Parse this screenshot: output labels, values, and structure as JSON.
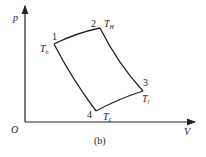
{
  "diagram": {
    "type": "p-V cycle diagram",
    "caption": "(b)",
    "axes": {
      "y_label": "p",
      "x_label": "V",
      "origin_label": "O"
    },
    "points": [
      {
        "id": "1",
        "label": "1",
        "temp": "T",
        "temp_sub": "h",
        "x": 54,
        "y": 44
      },
      {
        "id": "2",
        "label": "2",
        "temp": "T",
        "temp_sub": "H",
        "x": 100,
        "y": 28
      },
      {
        "id": "3",
        "label": "3",
        "temp": "T",
        "temp_sub": "l",
        "x": 143,
        "y": 91
      },
      {
        "id": "4",
        "label": "4",
        "temp": "T",
        "temp_sub": "L",
        "x": 96,
        "y": 111
      }
    ],
    "line_color": "#222222"
  }
}
